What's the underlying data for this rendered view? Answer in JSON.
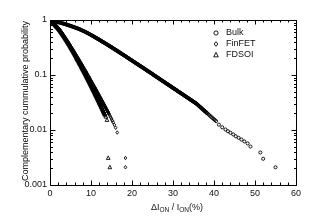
{
  "figure": {
    "background_color": "#ffffff",
    "axis_color": "#000000",
    "text_color": "#111111"
  },
  "chart_data": {
    "type": "scatter",
    "title": "",
    "xlabel": "ΔI_ON / I_ON(%)",
    "xlabel_parts": {
      "delta": "ΔI",
      "sub1": "ON",
      "slash": " / ",
      "i2": "I",
      "sub2": "ON",
      "percent": "(%)"
    },
    "ylabel": "Complementary cummulative probability",
    "xscale": "linear",
    "yscale": "log",
    "xlim": [
      0,
      60
    ],
    "ylim": [
      0.001,
      1
    ],
    "xticks": [
      0,
      10,
      20,
      30,
      40,
      50,
      60
    ],
    "xticklabels": [
      "0",
      "10",
      "20",
      "30",
      "40",
      "50",
      "60"
    ],
    "xminor_step": 2,
    "yticks": [
      1,
      0.1,
      0.01,
      0.001
    ],
    "yticklabels": [
      "1",
      "0.1",
      "0.01",
      "0.001"
    ],
    "grid": false,
    "legend_position": "upper right",
    "marker_color": "#000000",
    "series": [
      {
        "name": "Bulk",
        "marker": "circle",
        "marker_size": 3.1,
        "x": [
          0.0,
          0.35,
          0.7,
          1.05,
          1.4,
          1.75,
          2.1,
          2.45,
          2.8,
          3.15,
          3.5,
          3.85,
          4.2,
          4.55,
          4.9,
          5.25,
          5.6,
          5.95,
          6.3,
          6.65,
          7.0,
          7.35,
          7.7,
          8.05,
          8.4,
          8.75,
          9.1,
          9.45,
          9.8,
          10.15,
          10.5,
          10.9,
          11.3,
          11.7,
          12.1,
          12.5,
          12.9,
          13.3,
          13.7,
          14.1,
          14.5,
          14.9,
          15.3,
          15.7,
          16.1,
          16.5,
          16.9,
          17.3,
          17.7,
          18.1,
          18.5,
          18.9,
          19.3,
          19.7,
          20.1,
          20.5,
          20.9,
          21.3,
          21.7,
          22.1,
          22.5,
          22.9,
          23.3,
          23.7,
          24.1,
          24.5,
          24.9,
          25.3,
          25.7,
          26.1,
          26.5,
          26.9,
          27.3,
          27.7,
          28.1,
          28.5,
          28.9,
          29.3,
          29.7,
          30.1,
          30.5,
          30.9,
          31.3,
          31.7,
          32.1,
          32.5,
          32.9,
          33.3,
          33.7,
          34.1,
          34.5,
          34.9,
          35.3,
          35.7,
          36.0,
          36.3,
          36.6,
          36.9,
          37.2,
          37.5,
          37.8,
          38.1,
          38.4,
          38.7,
          39.0,
          39.3,
          39.6,
          39.9,
          40.2,
          40.5,
          41.2,
          42.0,
          42.8,
          43.4,
          44.0,
          44.7,
          45.3,
          46.0,
          46.7,
          47.4,
          48.2,
          48.9,
          51.3,
          52.0,
          55.0
        ],
        "y": [
          1.0,
          0.985,
          0.97,
          0.955,
          0.94,
          0.925,
          0.91,
          0.895,
          0.88,
          0.865,
          0.85,
          0.834,
          0.818,
          0.802,
          0.786,
          0.77,
          0.754,
          0.738,
          0.722,
          0.706,
          0.69,
          0.672,
          0.654,
          0.636,
          0.618,
          0.6,
          0.582,
          0.564,
          0.546,
          0.528,
          0.51,
          0.49,
          0.47,
          0.452,
          0.434,
          0.416,
          0.399,
          0.383,
          0.367,
          0.352,
          0.337,
          0.323,
          0.309,
          0.296,
          0.283,
          0.271,
          0.259,
          0.248,
          0.237,
          0.227,
          0.217,
          0.207,
          0.198,
          0.189,
          0.181,
          0.173,
          0.165,
          0.158,
          0.151,
          0.144,
          0.138,
          0.132,
          0.126,
          0.12,
          0.115,
          0.11,
          0.105,
          0.1,
          0.0955,
          0.0912,
          0.0871,
          0.0832,
          0.0794,
          0.0759,
          0.0724,
          0.0692,
          0.0661,
          0.0631,
          0.0603,
          0.0575,
          0.055,
          0.0525,
          0.0501,
          0.0479,
          0.0457,
          0.0437,
          0.0417,
          0.0398,
          0.038,
          0.0363,
          0.0347,
          0.0331,
          0.0316,
          0.0302,
          0.0288,
          0.0275,
          0.0263,
          0.0251,
          0.024,
          0.0229,
          0.0219,
          0.0209,
          0.02,
          0.0191,
          0.0182,
          0.0174,
          0.0166,
          0.0159,
          0.0152,
          0.0145,
          0.0125,
          0.0112,
          0.0102,
          0.0095,
          0.0089,
          0.0083,
          0.0077,
          0.0072,
          0.0067,
          0.0062,
          0.0057,
          0.005,
          0.0039,
          0.003,
          0.0021
        ]
      },
      {
        "name": "FinFET",
        "marker": "diamond",
        "marker_size": 3.1,
        "x": [
          0.0,
          0.2,
          0.4,
          0.6,
          0.8,
          1.0,
          1.2,
          1.4,
          1.6,
          1.8,
          2.0,
          2.2,
          2.4,
          2.6,
          2.8,
          3.0,
          3.2,
          3.4,
          3.6,
          3.8,
          4.0,
          4.2,
          4.4,
          4.6,
          4.8,
          5.0,
          5.2,
          5.4,
          5.6,
          5.8,
          6.0,
          6.2,
          6.4,
          6.6,
          6.8,
          7.0,
          7.2,
          7.4,
          7.6,
          7.8,
          8.0,
          8.2,
          8.4,
          8.6,
          8.8,
          9.0,
          9.2,
          9.4,
          9.6,
          9.8,
          10.0,
          10.2,
          10.4,
          10.6,
          10.8,
          11.0,
          11.2,
          11.4,
          11.6,
          11.8,
          12.0,
          12.2,
          12.4,
          12.6,
          12.8,
          13.0,
          13.2,
          13.4,
          13.6,
          13.8,
          14.0,
          14.2,
          14.4,
          14.6,
          14.8,
          15.0,
          15.2,
          15.4,
          15.7,
          16.0,
          16.4,
          18.4,
          18.4
        ],
        "y": [
          1.0,
          0.972,
          0.944,
          0.916,
          0.888,
          0.86,
          0.832,
          0.804,
          0.776,
          0.748,
          0.72,
          0.69,
          0.66,
          0.63,
          0.601,
          0.572,
          0.544,
          0.517,
          0.491,
          0.466,
          0.442,
          0.419,
          0.397,
          0.376,
          0.356,
          0.337,
          0.319,
          0.302,
          0.286,
          0.27,
          0.255,
          0.241,
          0.228,
          0.215,
          0.203,
          0.192,
          0.181,
          0.171,
          0.161,
          0.152,
          0.143,
          0.135,
          0.127,
          0.12,
          0.113,
          0.106,
          0.1,
          0.0941,
          0.0885,
          0.0832,
          0.0783,
          0.0736,
          0.0692,
          0.065,
          0.0611,
          0.0574,
          0.0539,
          0.0506,
          0.0476,
          0.0447,
          0.0419,
          0.0394,
          0.037,
          0.0347,
          0.0326,
          0.0306,
          0.0287,
          0.0269,
          0.0252,
          0.0237,
          0.0222,
          0.0208,
          0.0195,
          0.0182,
          0.017,
          0.0159,
          0.0148,
          0.0138,
          0.0124,
          0.011,
          0.009,
          0.0031,
          0.0021
        ]
      },
      {
        "name": "FDSOI",
        "marker": "triangle",
        "marker_size": 3.3,
        "x": [
          0.0,
          0.2,
          0.4,
          0.6,
          0.8,
          1.0,
          1.2,
          1.4,
          1.6,
          1.8,
          2.0,
          2.2,
          2.4,
          2.6,
          2.8,
          3.0,
          3.2,
          3.4,
          3.6,
          3.8,
          4.0,
          4.2,
          4.4,
          4.6,
          4.8,
          5.0,
          5.2,
          5.4,
          5.6,
          5.8,
          6.0,
          6.2,
          6.4,
          6.6,
          6.8,
          7.0,
          7.2,
          7.4,
          7.6,
          7.8,
          8.0,
          8.2,
          8.4,
          8.6,
          8.8,
          9.0,
          9.2,
          9.4,
          9.6,
          9.8,
          10.0,
          10.2,
          10.4,
          10.6,
          10.8,
          11.0,
          11.2,
          11.4,
          11.6,
          11.8,
          12.0,
          12.2,
          12.4,
          12.6,
          12.8,
          13.0,
          13.2,
          13.4,
          13.6,
          13.9,
          14.2,
          14.6
        ],
        "y": [
          1.0,
          0.968,
          0.936,
          0.905,
          0.874,
          0.844,
          0.814,
          0.784,
          0.755,
          0.726,
          0.698,
          0.668,
          0.638,
          0.609,
          0.58,
          0.552,
          0.525,
          0.498,
          0.473,
          0.448,
          0.424,
          0.401,
          0.379,
          0.358,
          0.338,
          0.319,
          0.301,
          0.284,
          0.268,
          0.252,
          0.237,
          0.223,
          0.21,
          0.197,
          0.185,
          0.174,
          0.163,
          0.153,
          0.144,
          0.135,
          0.126,
          0.118,
          0.111,
          0.104,
          0.0972,
          0.0909,
          0.085,
          0.0794,
          0.0741,
          0.0692,
          0.0646,
          0.0602,
          0.0562,
          0.0524,
          0.0488,
          0.0455,
          0.0424,
          0.0395,
          0.0368,
          0.0342,
          0.0318,
          0.0296,
          0.0275,
          0.0256,
          0.0237,
          0.022,
          0.0204,
          0.0189,
          0.0175,
          0.0152,
          0.0031,
          0.0021
        ]
      }
    ],
    "legend_entries": [
      {
        "label": "Bulk",
        "marker": "circle"
      },
      {
        "label": "FinFET",
        "marker": "diamond"
      },
      {
        "label": "FDSOI",
        "marker": "triangle"
      }
    ]
  },
  "layout": {
    "plot_left": 50,
    "plot_right": 296,
    "plot_top": 20,
    "plot_bottom": 185,
    "legend_x": 216,
    "legend_y": 33,
    "legend_row_height": 11
  }
}
